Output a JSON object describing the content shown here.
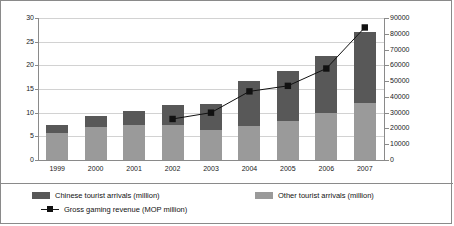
{
  "chart_data": {
    "type": "bar",
    "title": "",
    "subtitle": "",
    "xlabel": "",
    "ylabel": "",
    "grid": true,
    "legend_position": "bottom",
    "categories": [
      "1999",
      "2000",
      "2001",
      "2002",
      "2003",
      "2004",
      "2005",
      "2006",
      "2007"
    ],
    "axes": {
      "left": {
        "label": "",
        "min": 0,
        "max": 30,
        "step": 5,
        "ticks": [
          "0",
          "5",
          "10",
          "15",
          "20",
          "25",
          "30"
        ],
        "units": "million"
      },
      "right": {
        "label": "",
        "min": 0,
        "max": 90000,
        "step": 10000,
        "ticks": [
          "0",
          "10000",
          "20000",
          "30000",
          "40000",
          "50000",
          "60000",
          "70000",
          "80000",
          "90000"
        ],
        "units": "MOP million"
      }
    },
    "series": [
      {
        "name": "Other tourist arrivals (million)",
        "type": "bar",
        "stack": "arrivals",
        "axis": "left",
        "color": "#9a9a9a",
        "values": [
          5.8,
          6.9,
          7.4,
          7.4,
          6.3,
          7.2,
          8.3,
          10.0,
          12.1
        ]
      },
      {
        "name": "Chinese tourist arrivals (million)",
        "type": "bar",
        "stack": "arrivals",
        "axis": "left",
        "color": "#585858",
        "values": [
          1.6,
          2.4,
          2.9,
          4.2,
          5.6,
          9.5,
          10.5,
          12.0,
          14.9
        ]
      },
      {
        "name": "Gross gaming revenue (MOP million)",
        "type": "line",
        "axis": "right",
        "color": "#111111",
        "marker": "square",
        "values": [
          null,
          null,
          null,
          26000,
          30000,
          43500,
          47000,
          58000,
          84000
        ]
      }
    ],
    "totals_left_axis": [
      7.4,
      9.3,
      10.3,
      11.6,
      11.9,
      16.7,
      18.8,
      22.0,
      27.0
    ]
  },
  "legend": {
    "items": [
      {
        "key": "chinese",
        "label": "Chinese tourist arrivals (million)",
        "swatch": "dark-gray-swatch"
      },
      {
        "key": "other",
        "label": "Other tourist arrivals (million)",
        "swatch": "light-gray-swatch"
      },
      {
        "key": "revenue",
        "label": "Gross gaming revenue (MOP million)",
        "swatch": "line-square-marker"
      }
    ]
  }
}
